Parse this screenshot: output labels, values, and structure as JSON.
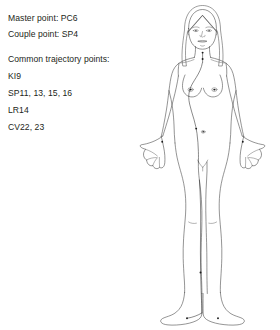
{
  "legend": {
    "master_point": "Master point: PC6",
    "couple_point": "Couple point: SP4",
    "common_heading": "Common trajectory points:",
    "points": [
      "KI9",
      "SP11, 13, 15, 16",
      "LR14",
      "CV22, 23"
    ]
  },
  "figure": {
    "line_color": "#3c3c3c",
    "point_color": "#1a1a1a",
    "background": "#ffffff",
    "trajectory_label": "chong mai trajectory line",
    "acupoints": [
      {
        "name": "CV23",
        "region": "throat"
      },
      {
        "name": "CV22",
        "region": "suprasternal notch"
      },
      {
        "name": "LR14",
        "region": "left breast"
      },
      {
        "name": "LR14",
        "region": "right breast"
      },
      {
        "name": "SP16",
        "region": "left abdomen"
      },
      {
        "name": "SP15",
        "region": "abdomen center right"
      },
      {
        "name": "PC6",
        "region": "left wrist"
      },
      {
        "name": "PC6",
        "region": "right wrist"
      },
      {
        "name": "KI9",
        "region": "left lower leg"
      },
      {
        "name": "SP4",
        "region": "left medial foot"
      },
      {
        "name": "SP4",
        "region": "right medial foot"
      }
    ]
  }
}
